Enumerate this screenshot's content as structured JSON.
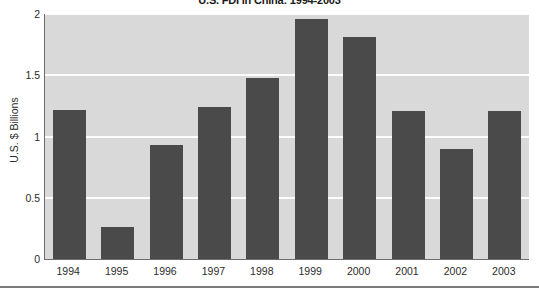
{
  "chart_data": {
    "type": "bar",
    "title": "U.S. FDI in China: 1994-2003",
    "xlabel": "",
    "ylabel": "U.S. $ Billions",
    "categories": [
      "1994",
      "1995",
      "1996",
      "1997",
      "1998",
      "1999",
      "2000",
      "2001",
      "2002",
      "2003"
    ],
    "values": [
      1.22,
      0.26,
      0.93,
      1.24,
      1.48,
      1.96,
      1.81,
      1.21,
      0.9,
      1.21
    ],
    "ylim": [
      0,
      2
    ],
    "yticks": [
      "0",
      "0.5",
      "1",
      "1.5",
      "2"
    ],
    "ytick_values": [
      0,
      0.5,
      1,
      1.5,
      2
    ],
    "grid": true,
    "legend": "none",
    "colors": {
      "bar": "#4a4a4a",
      "plot_background": "#d9d9d9",
      "gridline": "#ffffff",
      "axis": "#6d6d6d",
      "text": "#2b2b2b",
      "page_background": "#ffffff"
    }
  }
}
